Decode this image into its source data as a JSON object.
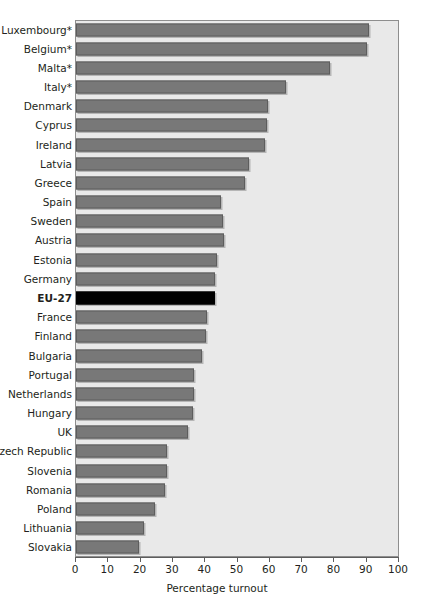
{
  "chart_data": {
    "type": "bar",
    "orientation": "horizontal",
    "title": "",
    "xlabel": "Percentage turnout",
    "ylabel": "",
    "xlim": [
      0,
      100
    ],
    "xticks": [
      0,
      10,
      20,
      30,
      40,
      50,
      60,
      70,
      80,
      90,
      100
    ],
    "grid": false,
    "legend": "none",
    "bar_color": "#787878",
    "highlight_color": "#000000",
    "plot_background": "#e9e9e9",
    "highlight_category": "EU-27",
    "footnote_marker": "*",
    "categories": [
      "Luxembourg*",
      "Belgium*",
      "Malta*",
      "Italy*",
      "Denmark",
      "Cyprus",
      "Ireland",
      "Latvia",
      "Greece",
      "Spain",
      "Sweden",
      "Austria",
      "Estonia",
      "Germany",
      "EU-27",
      "France",
      "Finland",
      "Bulgaria",
      "Portugal",
      "Netherlands",
      "Hungary",
      "UK",
      "Czech Republic",
      "Slovenia",
      "Romania",
      "Poland",
      "Lithuania",
      "Slovakia"
    ],
    "values": [
      91.0,
      90.4,
      78.8,
      65.1,
      59.5,
      59.4,
      58.6,
      53.7,
      52.6,
      44.9,
      45.5,
      45.9,
      43.9,
      43.3,
      43.2,
      40.6,
      40.3,
      39.0,
      36.8,
      36.8,
      36.3,
      34.7,
      28.2,
      28.3,
      27.7,
      24.5,
      21.0,
      19.6
    ]
  }
}
